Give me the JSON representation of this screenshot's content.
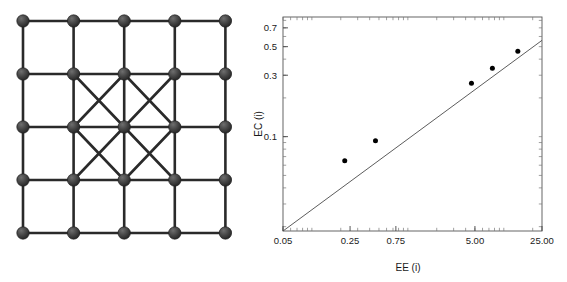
{
  "figure": {
    "panels": [
      "lattice-graph",
      "scatter-plot"
    ],
    "background_color": "#ffffff"
  },
  "lattice": {
    "name": "lattice-graph",
    "rows": 5,
    "cols": 5,
    "node_count": 25,
    "node_color": "#3a3a3a",
    "node_highlight_color": "#707070",
    "edge_color": "#2a2a2a",
    "node_radius": 6.2,
    "edge_width": 2.6,
    "diagonal_region": {
      "row_start": 1,
      "row_end": 3,
      "col_start": 1,
      "col_end": 3,
      "description": "both diagonals drawn in each of the four inner cells"
    },
    "origin_x": 23,
    "origin_y": 21,
    "dx": 50.6,
    "dy": 53.0
  },
  "chart_data": {
    "type": "scatter",
    "title": "",
    "xlabel": "EE (i)",
    "ylabel": "EC (i)",
    "xscale": "log",
    "yscale": "log",
    "xlim": [
      0.05,
      25.0
    ],
    "ylim": [
      0.0185,
      0.85
    ],
    "grid": false,
    "legend": null,
    "xticks": [
      0.05,
      0.25,
      0.75,
      5.0,
      25.0
    ],
    "xticklabels": [
      "0.05",
      "0.25",
      "0.75",
      "5.00",
      "25.00"
    ],
    "yticks": [
      0.1,
      0.3,
      0.5,
      0.7
    ],
    "yticklabels": [
      "0.1",
      "0.3",
      "0.5",
      "0.7"
    ],
    "minor_ticks": true,
    "points": [
      {
        "x": 0.22,
        "y": 0.065
      },
      {
        "x": 0.46,
        "y": 0.093
      },
      {
        "x": 4.6,
        "y": 0.26
      },
      {
        "x": 7.6,
        "y": 0.34
      },
      {
        "x": 14.0,
        "y": 0.46
      }
    ],
    "marker_color": "#000000",
    "marker_size": 4.0,
    "fit_line": {
      "type": "power-law",
      "x_start": 0.05,
      "y_start": 0.0185,
      "x_end": 25.0,
      "y_end": 0.56,
      "color": "#4a4a4a",
      "width": 0.9
    },
    "frame": {
      "left": 283,
      "right": 542,
      "top": 17,
      "bottom": 231,
      "color": "#555555",
      "width": 0.9
    }
  }
}
